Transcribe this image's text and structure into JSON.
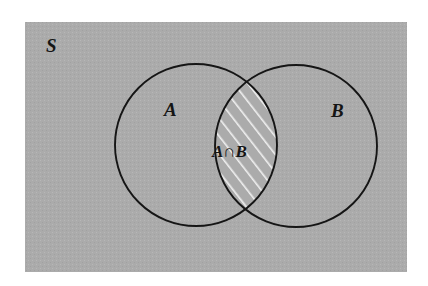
{
  "figure": {
    "type": "venn-diagram",
    "background_color": "#ffffff",
    "universe_fill": "#ababab",
    "stroke_color": "#151515",
    "hatch_color": "#f2f2f2"
  },
  "labels": {
    "universe": "S",
    "set_a": "A",
    "set_b": "B",
    "intersection": "A∩B"
  },
  "regions": {
    "universe_name": "universal-set-rectangle",
    "circle_a_name": "set-a-circle",
    "circle_b_name": "set-b-circle",
    "intersection_name": "intersection-region"
  },
  "geometry": {
    "rect": {
      "x": 25,
      "y": 22,
      "width": 382,
      "height": 250
    },
    "circle_a": {
      "cx": 196,
      "cy": 145,
      "r": 81
    },
    "circle_b": {
      "cx": 296,
      "cy": 146,
      "r": 81
    },
    "label_positions": {
      "universe": {
        "x": 46,
        "y": 52
      },
      "set_a": {
        "x": 164,
        "y": 116
      },
      "set_b": {
        "x": 331,
        "y": 117
      },
      "intersection": {
        "x": 212,
        "y": 157
      }
    }
  }
}
